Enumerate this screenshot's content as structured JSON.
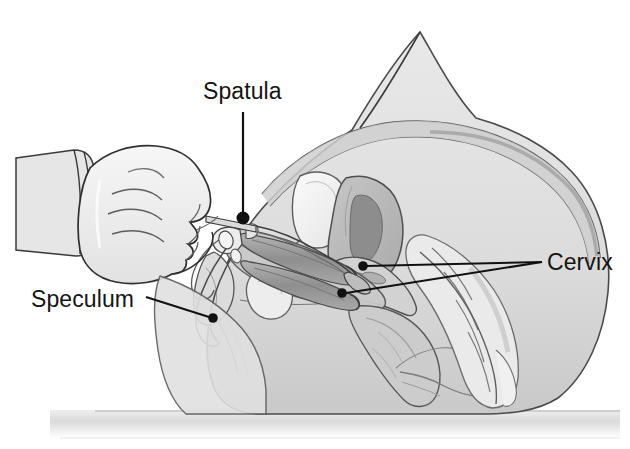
{
  "figure": {
    "domain_note": "medical line illustration, grayscale",
    "width": 630,
    "height": 449,
    "background_color": "#ffffff"
  },
  "labels": [
    {
      "id": "spatula",
      "text": "Spatula",
      "text_x": 203,
      "text_y": 78,
      "leader": {
        "from_x": 243,
        "from_y": 112,
        "to_x": 243,
        "to_y": 214
      },
      "dot": {
        "x": 243,
        "y": 218,
        "r": 6
      }
    },
    {
      "id": "speculum",
      "text": "Speculum",
      "text_x": 31,
      "text_y": 286,
      "leader": {
        "from_x": 146,
        "from_y": 297,
        "to_x": 210,
        "to_y": 317
      },
      "dot": {
        "x": 213,
        "y": 318,
        "r": 4.5
      }
    },
    {
      "id": "cervix",
      "text": "Cervix",
      "text_x": 547,
      "text_y": 249,
      "leader_converge": {
        "x": 542,
        "y": 262
      },
      "leaders": [
        {
          "from_x": 542,
          "from_y": 262,
          "to_x": 366,
          "to_y": 266
        },
        {
          "from_x": 542,
          "from_y": 262,
          "to_x": 346,
          "to_y": 293
        }
      ],
      "dots": [
        {
          "x": 363,
          "y": 266,
          "r": 4.5
        },
        {
          "x": 342,
          "y": 293,
          "r": 4.5
        }
      ]
    }
  ],
  "anatomy_parts": [
    {
      "name": "torso-body-outline",
      "fill": "#e2e2e2"
    },
    {
      "name": "abdominal-wall",
      "fill": "#d6d6d6"
    },
    {
      "name": "bladder",
      "fill": "#f2f2f2"
    },
    {
      "name": "uterus",
      "fill": "#b9b9b9"
    },
    {
      "name": "uterine-cavity",
      "fill": "#8d8d8d"
    },
    {
      "name": "cervix",
      "fill": "#d2d2d2"
    },
    {
      "name": "vaginal-canal",
      "fill": "#c9c9c9"
    },
    {
      "name": "rectum",
      "fill": "#cccccc"
    },
    {
      "name": "sacrum-vertebrae",
      "fill": "#eaeaea"
    },
    {
      "name": "pubic-bone",
      "fill": "#ededed"
    },
    {
      "name": "examination-table",
      "fill": "#dcdcdc"
    }
  ],
  "instruments": [
    {
      "name": "speculum-upper-blade",
      "fill": "#a6a6a6"
    },
    {
      "name": "speculum-lower-blade",
      "fill": "#9a9a9a"
    },
    {
      "name": "speculum-handle",
      "fill": "#e8e8e8"
    },
    {
      "name": "spatula-shaft",
      "fill": "#dadada"
    },
    {
      "name": "spatula-tip",
      "fill": "#bdbdbd"
    }
  ],
  "examiner": {
    "name": "gloved-hand",
    "glove_fill": "#ececec",
    "cuff_fill": "#e0e0e0",
    "outline": "#333333"
  },
  "colors": {
    "line": "#2b2b2b",
    "label_text": "#141414",
    "leader": "#111111",
    "table_surface": "#dcdcdc",
    "table_edge": "#c4c4c4"
  }
}
